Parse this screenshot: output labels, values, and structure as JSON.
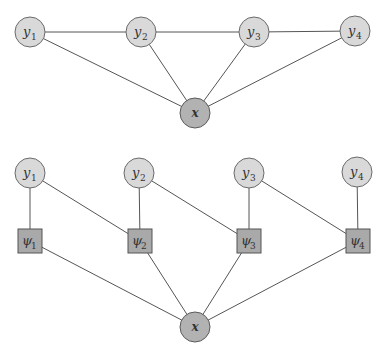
{
  "colors": {
    "background": "#ffffff",
    "variable_fill": "#d9d9d9",
    "observed_fill": "#b2b2b2",
    "factor_fill": "#a9a9a9",
    "edge": "#555555"
  },
  "top_graph": {
    "description": "Undirected graph (CRF): chain of y nodes, each connected to x",
    "nodes": [
      {
        "id": "y1",
        "base": "y",
        "sub": "1",
        "shape": "circle",
        "cx": 30,
        "cy": 32
      },
      {
        "id": "y2",
        "base": "y",
        "sub": "2",
        "shape": "circle",
        "cx": 141,
        "cy": 32
      },
      {
        "id": "y3",
        "base": "y",
        "sub": "3",
        "shape": "circle",
        "cx": 254,
        "cy": 32
      },
      {
        "id": "y4",
        "base": "y",
        "sub": "4",
        "shape": "circle",
        "cx": 355,
        "cy": 31
      },
      {
        "id": "x",
        "base": "x",
        "sub": "",
        "shape": "circle-observed",
        "cx": 195,
        "cy": 113
      }
    ],
    "edges": [
      [
        "y1",
        "y2"
      ],
      [
        "y2",
        "y3"
      ],
      [
        "y3",
        "y4"
      ],
      [
        "y1",
        "x"
      ],
      [
        "y2",
        "x"
      ],
      [
        "y3",
        "x"
      ],
      [
        "y4",
        "x"
      ]
    ]
  },
  "bottom_graph": {
    "description": "Factor graph: y nodes connected to psi factors, psi factors connected to x",
    "nodes": [
      {
        "id": "y1",
        "base": "y",
        "sub": "1",
        "shape": "circle",
        "cx": 30,
        "cy": 173
      },
      {
        "id": "y2",
        "base": "y",
        "sub": "2",
        "shape": "circle",
        "cx": 139,
        "cy": 173
      },
      {
        "id": "y3",
        "base": "y",
        "sub": "3",
        "shape": "circle",
        "cx": 249,
        "cy": 173
      },
      {
        "id": "y4",
        "base": "y",
        "sub": "4",
        "shape": "circle",
        "cx": 357,
        "cy": 172
      },
      {
        "id": "psi1",
        "base": "ψ",
        "sub": "1",
        "shape": "square",
        "cx": 30,
        "cy": 241
      },
      {
        "id": "psi2",
        "base": "ψ",
        "sub": "2",
        "shape": "square",
        "cx": 140,
        "cy": 241
      },
      {
        "id": "psi3",
        "base": "ψ",
        "sub": "3",
        "shape": "square",
        "cx": 249,
        "cy": 241
      },
      {
        "id": "psi4",
        "base": "ψ",
        "sub": "4",
        "shape": "square",
        "cx": 358,
        "cy": 241
      },
      {
        "id": "x",
        "base": "x",
        "sub": "",
        "shape": "circle-observed",
        "cx": 195,
        "cy": 327
      }
    ],
    "edges": [
      [
        "y1",
        "psi1"
      ],
      [
        "y1",
        "psi2"
      ],
      [
        "y2",
        "psi2"
      ],
      [
        "y2",
        "psi3"
      ],
      [
        "y3",
        "psi3"
      ],
      [
        "y3",
        "psi4"
      ],
      [
        "y4",
        "psi4"
      ],
      [
        "psi1",
        "x"
      ],
      [
        "psi2",
        "x"
      ],
      [
        "psi3",
        "x"
      ],
      [
        "psi4",
        "x"
      ]
    ]
  },
  "labels": {
    "y": "y",
    "x": "x",
    "psi": "ψ",
    "sub1": "1",
    "sub2": "2",
    "sub3": "3",
    "sub4": "4"
  }
}
